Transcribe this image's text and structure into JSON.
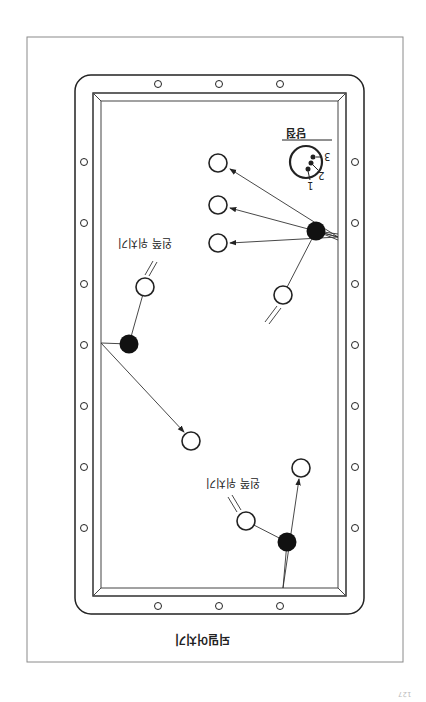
{
  "figure": {
    "title": "되밀어치기",
    "orientation": "rotated 180 degrees",
    "cue_point_label": "당점",
    "cue_point_numbers": [
      "1",
      "2",
      "3"
    ],
    "annotations": [
      {
        "id": "left",
        "text": "왼쪽 위치기"
      },
      {
        "id": "bottom",
        "text": "왼쪽 위치기"
      }
    ],
    "page_number": "127"
  },
  "table": {
    "rail_diamonds_top": 3,
    "rail_diamonds_bottom": 3,
    "rail_diamonds_left": 7,
    "rail_diamonds_right": 7
  },
  "balls": {
    "hollow": [
      {
        "x": 218,
        "y": 163
      },
      {
        "x": 218,
        "y": 205
      },
      {
        "x": 218,
        "y": 243
      },
      {
        "x": 283,
        "y": 295
      },
      {
        "x": 145,
        "y": 287
      },
      {
        "x": 191,
        "y": 441
      },
      {
        "x": 246,
        "y": 521
      },
      {
        "x": 301,
        "y": 468
      }
    ],
    "solid": [
      {
        "x": 316,
        "y": 231
      },
      {
        "x": 129,
        "y": 344
      },
      {
        "x": 287,
        "y": 542
      }
    ]
  },
  "colors": {
    "line": "#222222",
    "frame": "#888888",
    "background": "#ffffff"
  }
}
